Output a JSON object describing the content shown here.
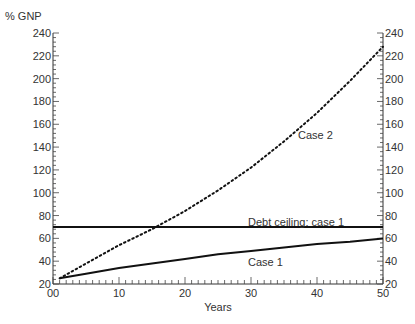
{
  "chart_data": {
    "type": "line",
    "title": "",
    "xlabel": "Years",
    "ylabel": "% GNP",
    "xlim": [
      0,
      50
    ],
    "ylim": [
      20,
      240
    ],
    "x_ticks": [
      "00",
      "10",
      "20",
      "30",
      "40",
      "50"
    ],
    "y_ticks": [
      "20",
      "40",
      "60",
      "80",
      "100",
      "120",
      "140",
      "160",
      "180",
      "200",
      "220",
      "240"
    ],
    "grid": false,
    "legend": "inline labels",
    "series": [
      {
        "name": "Case 2",
        "style": "dotted",
        "x": [
          1,
          5,
          10,
          15,
          20,
          25,
          30,
          35,
          40,
          45,
          50
        ],
        "values": [
          25,
          38,
          54,
          68,
          84,
          102,
          122,
          145,
          170,
          198,
          228
        ]
      },
      {
        "name": "Debt ceiling: case 1",
        "style": "solid",
        "x": [
          0,
          50
        ],
        "values": [
          70,
          70
        ]
      },
      {
        "name": "Case 1",
        "style": "solid",
        "x": [
          1,
          5,
          10,
          15,
          20,
          25,
          30,
          35,
          40,
          45,
          50
        ],
        "values": [
          25,
          29,
          34,
          38,
          42,
          46,
          49,
          52,
          55,
          57,
          60
        ]
      }
    ],
    "annotations": [
      "Case 2",
      "Debt ceiling: case 1",
      "Case 1"
    ]
  },
  "labels": {
    "ylabel": "% GNP",
    "xlabel": "Years",
    "case2": "Case 2",
    "ceiling": "Debt ceiling: case 1",
    "case1": "Case 1"
  }
}
